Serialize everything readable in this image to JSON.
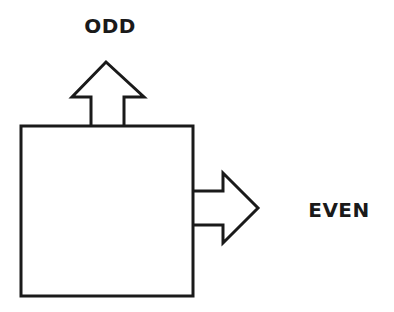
{
  "diagram": {
    "title": "",
    "stroke_color": "#1a1a1a",
    "fill_color": "#ffffff",
    "nodes": [
      {
        "id": "box",
        "shape": "rectangle",
        "label": ""
      }
    ],
    "outputs": [
      {
        "id": "odd",
        "direction": "up",
        "label": "ODD"
      },
      {
        "id": "even",
        "direction": "right",
        "label": "EVEN"
      }
    ]
  }
}
